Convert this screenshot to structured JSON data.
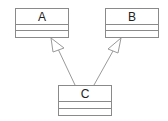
{
  "diagram": {
    "type": "uml-class-diagram",
    "classes": [
      {
        "id": "A",
        "name": "A",
        "attributes": [],
        "methods": []
      },
      {
        "id": "B",
        "name": "B",
        "attributes": [],
        "methods": []
      },
      {
        "id": "C",
        "name": "C",
        "attributes": [],
        "methods": []
      }
    ],
    "relations": [
      {
        "from": "C",
        "to": "A",
        "kind": "generalization"
      },
      {
        "from": "C",
        "to": "B",
        "kind": "generalization"
      }
    ]
  },
  "colors": {
    "line": "#8a8a8a",
    "text": "#222222",
    "background": "#ffffff"
  }
}
